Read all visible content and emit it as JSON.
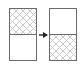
{
  "diagram": {
    "left_panel": {
      "top_half": "hatched",
      "bottom_half": "empty"
    },
    "arrow": {
      "direction": "right",
      "icon": "arrow-right-icon"
    },
    "right_panel": {
      "top_half": "empty",
      "bottom_half": "hatched"
    },
    "colors": {
      "border": "#6b6b6b",
      "hatch": "#c9c9c9",
      "background": "#ffffff",
      "arrow": "#222222"
    }
  }
}
